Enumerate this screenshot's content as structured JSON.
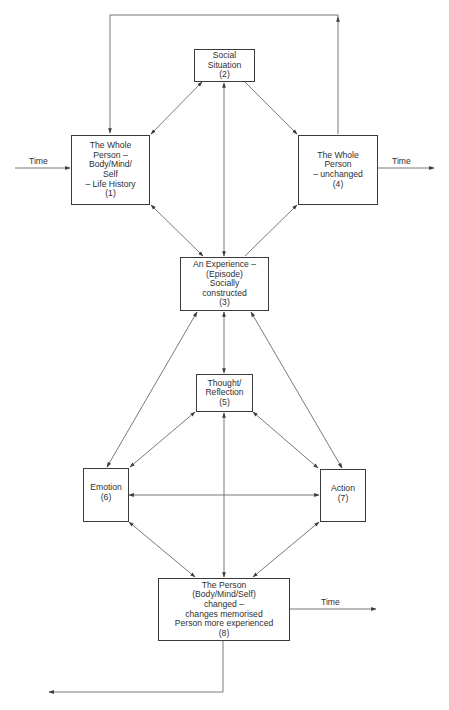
{
  "diagram": {
    "type": "flow-diagram",
    "title": "",
    "nodes": [
      {
        "id": "1",
        "lines": [
          "The Whole",
          "Person –",
          "Body/Mind/",
          "Self",
          "– Life History",
          "(1)"
        ]
      },
      {
        "id": "2",
        "lines": [
          "Social",
          "Situation",
          "(2)"
        ]
      },
      {
        "id": "3",
        "lines": [
          "An Experience –",
          "(Episode)",
          "Socially",
          "constructed",
          "(3)"
        ]
      },
      {
        "id": "4",
        "lines": [
          "The Whole",
          "Person",
          "– unchanged",
          "(4)"
        ]
      },
      {
        "id": "5",
        "lines": [
          "Thought/",
          "Reflection",
          "(5)"
        ]
      },
      {
        "id": "6",
        "lines": [
          "Emotion",
          "(6)"
        ]
      },
      {
        "id": "7",
        "lines": [
          "Action",
          "(7)"
        ]
      },
      {
        "id": "8",
        "lines": [
          "The Person",
          "(Body/Mind/Self)",
          "changed –",
          "changes memorised",
          "Person more experienced",
          "(8)"
        ]
      }
    ],
    "edges": [
      {
        "from": "2",
        "to": "1",
        "direction": "both"
      },
      {
        "from": "2",
        "to": "4",
        "direction": "forward"
      },
      {
        "from": "3",
        "to": "2",
        "direction": "both"
      },
      {
        "from": "1",
        "to": "3",
        "direction": "both"
      },
      {
        "from": "3",
        "to": "4",
        "direction": "forward"
      },
      {
        "from": "4",
        "to": "1",
        "direction": "forward",
        "route": "top-loop"
      },
      {
        "from": "3",
        "to": "5",
        "direction": "both"
      },
      {
        "from": "3",
        "to": "6",
        "direction": "both"
      },
      {
        "from": "3",
        "to": "7",
        "direction": "both"
      },
      {
        "from": "5",
        "to": "6",
        "direction": "both"
      },
      {
        "from": "5",
        "to": "7",
        "direction": "both"
      },
      {
        "from": "6",
        "to": "7",
        "direction": "both"
      },
      {
        "from": "5",
        "to": "8",
        "direction": "both"
      },
      {
        "from": "6",
        "to": "8",
        "direction": "both"
      },
      {
        "from": "7",
        "to": "8",
        "direction": "both"
      },
      {
        "from": "8",
        "to": "out-left",
        "direction": "forward",
        "route": "bottom-return"
      }
    ],
    "time_labels": {
      "input_to_1": "Time",
      "output_from_4": "Time",
      "output_from_8": "Time"
    },
    "colors": {
      "line": "#5a5a5a",
      "box_border": "#3a3a3a",
      "text": "#2f2f2f",
      "background": "#ffffff"
    }
  },
  "caption": {
    "text": ""
  }
}
